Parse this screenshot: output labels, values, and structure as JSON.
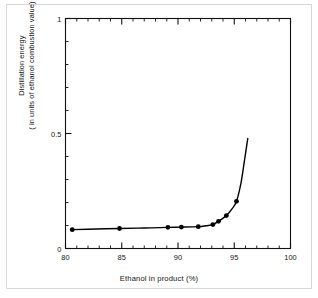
{
  "chart_data": {
    "type": "line",
    "title": "",
    "xlabel": "Ethanol in product (%)",
    "ylabel_line1": "Distillation energy",
    "ylabel_line2": "( in units of ethanol combustion value)",
    "xlim": [
      80,
      100
    ],
    "ylim": [
      0,
      1
    ],
    "x_major_ticks": [
      80,
      85,
      90,
      95,
      100
    ],
    "x_tick_labels": [
      "80",
      "85",
      "90",
      "95",
      "100"
    ],
    "x_minor_step": 1,
    "y_major_ticks": [
      0,
      0.5,
      1
    ],
    "y_tick_labels": [
      "0",
      "0.5",
      "1"
    ],
    "y_minor_step": 0.1,
    "grid": false,
    "legend": null,
    "marker": "filled-circle",
    "marker_color": "#000000",
    "line_color": "#000000",
    "series": [
      {
        "name": "Distillation energy",
        "x": [
          80.6,
          84.8,
          89.1,
          90.3,
          91.8,
          93.1,
          93.6,
          94.3,
          95.2
        ],
        "y": [
          0.082,
          0.087,
          0.092,
          0.093,
          0.095,
          0.104,
          0.118,
          0.143,
          0.205
        ]
      }
    ],
    "curve_x": [
      80.6,
      82.0,
      84.8,
      87.0,
      89.1,
      90.3,
      91.8,
      92.5,
      93.1,
      93.6,
      94.3,
      94.8,
      95.2,
      95.6,
      95.9,
      96.2
    ],
    "curve_y": [
      0.082,
      0.084,
      0.087,
      0.089,
      0.092,
      0.093,
      0.095,
      0.099,
      0.104,
      0.118,
      0.143,
      0.172,
      0.205,
      0.285,
      0.38,
      0.478
    ]
  }
}
